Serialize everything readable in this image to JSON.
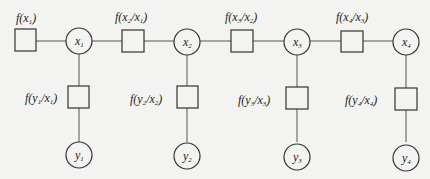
{
  "diagram": {
    "type": "factor-graph",
    "colors": {
      "background": "#f3f3f1",
      "stroke": "#333333",
      "edge": "#555555",
      "text": "#222222"
    },
    "hidden_nodes": [
      {
        "id": "x1",
        "base": "x",
        "sub": "1"
      },
      {
        "id": "x2",
        "base": "x",
        "sub": "2"
      },
      {
        "id": "x3",
        "base": "x",
        "sub": "3"
      },
      {
        "id": "x4",
        "base": "x",
        "sub": "4"
      }
    ],
    "observed_nodes": [
      {
        "id": "y1",
        "base": "y",
        "sub": "1"
      },
      {
        "id": "y2",
        "base": "y",
        "sub": "2"
      },
      {
        "id": "y3",
        "base": "y",
        "sub": "3"
      },
      {
        "id": "y4",
        "base": "y",
        "sub": "4"
      }
    ],
    "prior_factor": {
      "label": "f(x1)",
      "f": "f(",
      "a": "x",
      "as": "1",
      "close": ")"
    },
    "transition_factors": [
      {
        "label": "f(x2/x1)",
        "f": "f(",
        "a": "x",
        "as": "2",
        "sep": "/",
        "b": "x",
        "bs": "1",
        "close": ")"
      },
      {
        "label": "f(x3/x2)",
        "f": "f(",
        "a": "x",
        "as": "3",
        "sep": "/",
        "b": "x",
        "bs": "2",
        "close": ")"
      },
      {
        "label": "f(x4/x3)",
        "f": "f(",
        "a": "x",
        "as": "4",
        "sep": "/",
        "b": "x",
        "bs": "3",
        "close": ")"
      }
    ],
    "observation_factors": [
      {
        "label": "f(y1/x1)",
        "f": "f(",
        "a": "y",
        "as": "1",
        "sep": "/",
        "b": "x",
        "bs": "1",
        "close": ")"
      },
      {
        "label": "f(y2/x2)",
        "f": "f(",
        "a": "y",
        "as": "2",
        "sep": "/",
        "b": "x",
        "bs": "2",
        "close": ")"
      },
      {
        "label": "f(y3/x3)",
        "f": "f(",
        "a": "y",
        "as": "3",
        "sep": "/",
        "b": "x",
        "bs": "3",
        "close": ")"
      },
      {
        "label": "f(y4/x4)",
        "f": "f(",
        "a": "y",
        "as": "4",
        "sep": "/",
        "b": "x",
        "bs": "4",
        "close": ")"
      }
    ]
  }
}
